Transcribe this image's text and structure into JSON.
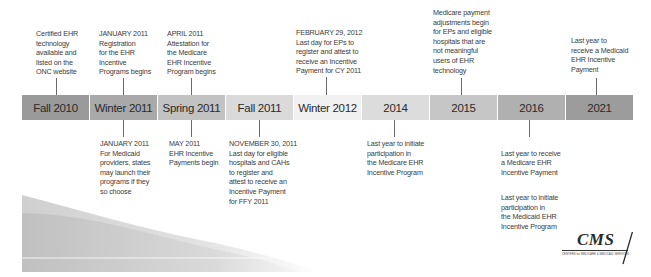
{
  "timeline": {
    "segments": [
      {
        "label": "Fall 2010",
        "color": "#9a9a9a"
      },
      {
        "label": "Winter 2011",
        "color": "#a9a9a9"
      },
      {
        "label": "Spring 2011",
        "color": "#c2c2c2"
      },
      {
        "label": "Fall 2011",
        "color": "#dadada"
      },
      {
        "label": "Winter 2012",
        "color": "#f1f1f1"
      },
      {
        "label": "2014",
        "color": "#dcdcdc"
      },
      {
        "label": "2015",
        "color": "#c6c6c6"
      },
      {
        "label": "2016",
        "color": "#b0b0b0"
      },
      {
        "label": "2021",
        "color": "#9c9c9c"
      }
    ],
    "top_notes": [
      {
        "segment": "Fall 2010",
        "text": "Certified EHR\ntechnology\navailable and\nlisted on the\nONC website"
      },
      {
        "segment": "Winter 2011",
        "text": "JANUARY 2011\nRegistration\nfor the EHR\nIncentive\nPrograms begins"
      },
      {
        "segment": "Spring 2011",
        "text": "APRIL 2011\nAttestation for\nthe Medicare\nEHR Incentive\nProgram begins"
      },
      {
        "segment": "Winter 2012",
        "text": "FEBRUARY 29, 2012\nLast day for EPs to\nregister and attest to\nreceive an Incentive\nPayment for CY 2011"
      },
      {
        "segment": "2015",
        "text": "Medicare payment\nadjustments begin\nfor EPs and eligible\nhospitals that are\nnot meaningful\nusers of EHR\ntechnology"
      },
      {
        "segment": "2021",
        "text": "Last year to\nreceive a Medicaid\nEHR Incentive\nPayment"
      }
    ],
    "bottom_notes": [
      {
        "segment": "Winter 2011",
        "text": "JANUARY 2011\nFor Medicaid\nproviders, states\nmay launch their\nprograms if they\nso choose"
      },
      {
        "segment": "Spring 2011",
        "text": "MAY 2011\nEHR Incentive\nPayments begin"
      },
      {
        "segment": "Fall 2011",
        "text": "NOVEMBER 30, 2011\nLast day for eligible\nhospitals and CAHs\nto register and\nattest to receive an\nIncentive Payment\nfor FFY 2011"
      },
      {
        "segment": "2014",
        "text": "Last year to initiate\nparticipation in\nthe Medicare EHR\nIncentive Program"
      },
      {
        "segment": "2016",
        "text": "Last year to receive\na Medicare EHR\nIncentive Payment",
        "text2": "Last year to initiate\nparticipation in\nthe Medicaid EHR\nIncentive Program"
      }
    ]
  },
  "logo": {
    "name": "CMS",
    "subtitle": "CENTERS for MEDICARE & MEDICAID SERVICES"
  }
}
